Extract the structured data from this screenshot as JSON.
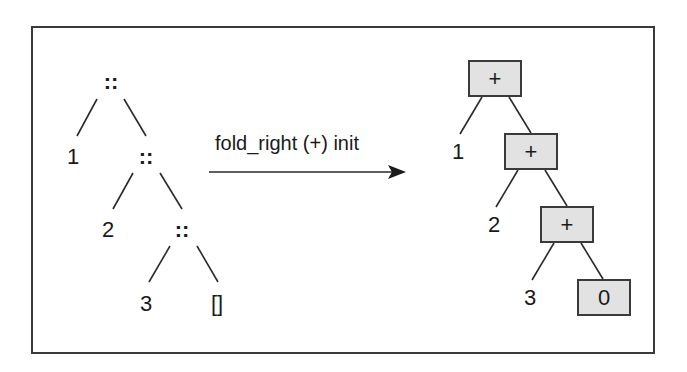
{
  "diagram": {
    "type": "tree-transformation",
    "left_tree": {
      "description": "list 1 :: 2 :: 3 :: []",
      "nodes": [
        {
          "id": "cons1",
          "label": "::"
        },
        {
          "id": "n1",
          "label": "1"
        },
        {
          "id": "cons2",
          "label": "::"
        },
        {
          "id": "n2",
          "label": "2"
        },
        {
          "id": "cons3",
          "label": "::"
        },
        {
          "id": "n3",
          "label": "3"
        },
        {
          "id": "nil",
          "label": "[]"
        }
      ]
    },
    "arrow": {
      "label": "fold_right (+) init",
      "icon": "arrow-right-icon"
    },
    "right_tree": {
      "description": "1 + (2 + (3 + 0))",
      "nodes": [
        {
          "id": "plus1",
          "label": "+",
          "boxed": true
        },
        {
          "id": "r1",
          "label": "1"
        },
        {
          "id": "plus2",
          "label": "+",
          "boxed": true
        },
        {
          "id": "r2",
          "label": "2"
        },
        {
          "id": "plus3",
          "label": "+",
          "boxed": true
        },
        {
          "id": "r3",
          "label": "3"
        },
        {
          "id": "init",
          "label": "0",
          "boxed": true
        }
      ]
    },
    "colors": {
      "box_fill": "#e2e2e2",
      "stroke": "#3a3a3a",
      "text": "#1a1a1a"
    }
  }
}
